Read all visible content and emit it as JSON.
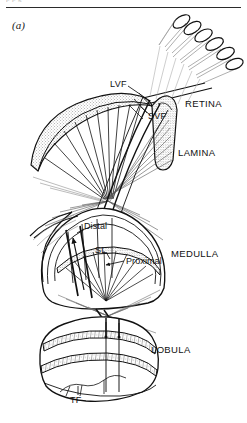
{
  "figure": {
    "panel_label": "(a)",
    "header_ghost_text": "p           p                 g",
    "background_color": "#ffffff",
    "ink_color": "#111111",
    "stipple_color": "#555555",
    "fiber_color": "#444444"
  },
  "labels": {
    "lvf": "LVF",
    "svf": "SVF",
    "retina": "RETINA",
    "lamina": "LAMINA",
    "medulla": "MEDULLA",
    "lobula": "LOBULA",
    "distal": "Distal",
    "sl": "SL",
    "proximal": "Proximal",
    "tf": "TF"
  },
  "regions": [
    {
      "name": "retina",
      "label": "RETINA",
      "type": "ommatidia-bundle",
      "position": "top-right"
    },
    {
      "name": "lamina",
      "label": "LAMINA",
      "type": "stippled-curved-band",
      "position": "upper-left"
    },
    {
      "name": "medulla",
      "label": "MEDULLA",
      "type": "domed-layered-body",
      "position": "middle"
    },
    {
      "name": "lobula",
      "label": "LOBULA",
      "type": "rounded-body-two-bands",
      "position": "bottom"
    }
  ],
  "annotations": [
    {
      "name": "lvf",
      "text": "LVF",
      "meaning": "long visual fibre",
      "has_leader_line": true
    },
    {
      "name": "svf",
      "text": "SVF",
      "meaning": "short visual fibre",
      "has_leader_line": true
    },
    {
      "name": "distal",
      "text": "Distal",
      "has_leader_line": true
    },
    {
      "name": "sl",
      "text": "SL",
      "has_leader_line": true
    },
    {
      "name": "proximal",
      "text": "Proximal",
      "has_leader_line": true
    },
    {
      "name": "tf",
      "text": "TF",
      "has_leader_line": true
    }
  ]
}
